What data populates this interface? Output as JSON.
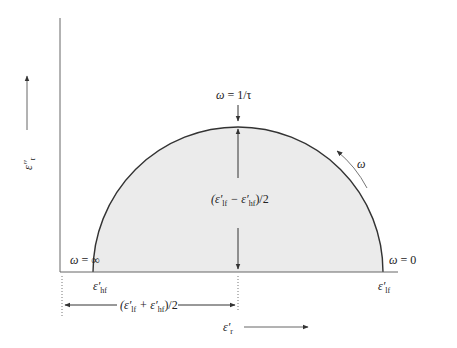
{
  "diagram": {
    "type": "Cole-Cole semicircle plot",
    "axes": {
      "y_label": {
        "symbol": "ε″",
        "subscript": "r"
      },
      "x_label": {
        "symbol": "ε′",
        "subscript": "r"
      }
    },
    "annotations": {
      "peak_freq": {
        "lhs": "ω",
        "eq": " = ",
        "rhs": "1/τ"
      },
      "radius": {
        "open": "(ε′",
        "sub1": "lf",
        "minus": " − ε′",
        "sub2": "hf",
        "close": ")/2"
      },
      "center": {
        "open": "(ε′",
        "sub1": "lf",
        "plus": " + ε′",
        "sub2": "hf",
        "close": ")/2"
      },
      "omega_inf": {
        "lhs": "ω",
        "eq": " = ",
        "rhs": "∞"
      },
      "omega_zero": {
        "lhs": "ω",
        "eq": " = ",
        "rhs": "0"
      },
      "eps_hf": {
        "symbol": "ε′",
        "subscript": "hf"
      },
      "eps_lf": {
        "symbol": "ε′",
        "subscript": "lf"
      },
      "omega_dir": "ω"
    },
    "colors": {
      "fill": "#ebebeb",
      "curve": "#333333",
      "axis": "#555555",
      "arrow": "#444444"
    }
  }
}
